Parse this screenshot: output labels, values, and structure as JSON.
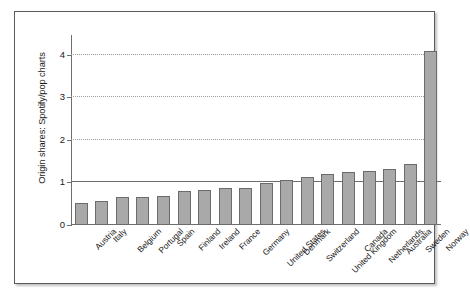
{
  "chart_data": {
    "type": "bar",
    "title": "",
    "xlabel": "",
    "ylabel": "Origin shares: Spotify/pop charts",
    "ylim": [
      0,
      4.35
    ],
    "yticks": [
      0,
      1,
      2,
      3,
      4
    ],
    "ytick_labels": [
      "0",
      "1",
      "2",
      "3",
      "4"
    ],
    "grid": true,
    "grid_axis": "y",
    "reference_line": 1,
    "legend": "none",
    "bar_color": "#a9a9a9",
    "bar_edge_color": "#6b6b6b",
    "categories": [
      "Austria",
      "Italy",
      "Belgium",
      "Portugal",
      "Spain",
      "Finland",
      "Ireland",
      "France",
      "Germany",
      "United States",
      "Denmark",
      "Switzerland",
      "United Kingdom",
      "Canada",
      "Netherlands",
      "Australia",
      "Sweden",
      "Norway"
    ],
    "values": [
      0.51,
      0.57,
      0.66,
      0.67,
      0.68,
      0.81,
      0.83,
      0.86,
      0.87,
      0.99,
      1.05,
      1.12,
      1.2,
      1.25,
      1.27,
      1.32,
      1.43,
      4.08
    ]
  }
}
